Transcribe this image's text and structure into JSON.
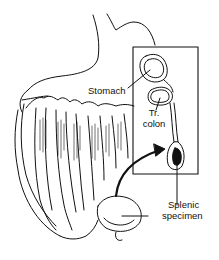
{
  "figure": {
    "labels": {
      "stomach": "Stomach",
      "tr_colon_line1": "Tr.",
      "tr_colon_line2": "colon",
      "splenic_line1": "Splenic",
      "splenic_line2": "specimen"
    },
    "colors": {
      "ink": "#111111",
      "background": "#ffffff",
      "specimen_fill": "#111111"
    }
  }
}
